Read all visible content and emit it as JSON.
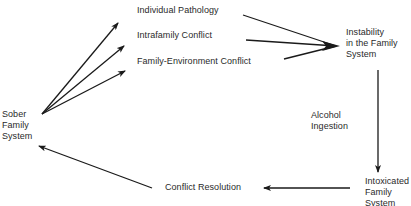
{
  "diagram": {
    "type": "flow-cycle",
    "nodes": {
      "sober": {
        "lines": [
          "Sober",
          "Family",
          "System"
        ]
      },
      "individual_pathology": {
        "label": "Individual Pathology"
      },
      "intrafamily_conflict": {
        "label": "Intrafamily Conflict"
      },
      "family_environment_conflict": {
        "label": "Family-Environment Conflict"
      },
      "instability": {
        "lines": [
          "Instability",
          "in the Family",
          "System"
        ]
      },
      "alcohol_ingestion": {
        "lines": [
          "Alcohol",
          "Ingestion"
        ]
      },
      "intoxicated": {
        "lines": [
          "Intoxicated",
          "Family",
          "System"
        ]
      },
      "conflict_resolution": {
        "label": "Conflict Resolution"
      }
    },
    "edges": [
      {
        "from": "Sober Family System",
        "to": "Individual Pathology"
      },
      {
        "from": "Sober Family System",
        "to": "Intrafamily Conflict"
      },
      {
        "from": "Sober Family System",
        "to": "Family-Environment Conflict"
      },
      {
        "from": "Individual Pathology",
        "to": "Instability in the Family System"
      },
      {
        "from": "Intrafamily Conflict",
        "to": "Instability in the Family System"
      },
      {
        "from": "Family-Environment Conflict",
        "to": "Instability in the Family System"
      },
      {
        "from": "Instability in the Family System",
        "to": "Intoxicated Family System",
        "label": "Alcohol Ingestion"
      },
      {
        "from": "Intoxicated Family System",
        "to": "Conflict Resolution"
      },
      {
        "from": "Conflict Resolution",
        "to": "Sober Family System"
      }
    ],
    "colors": {
      "line": "#1a1a1a",
      "text": "#2a2a2a",
      "background": "#ffffff"
    }
  }
}
